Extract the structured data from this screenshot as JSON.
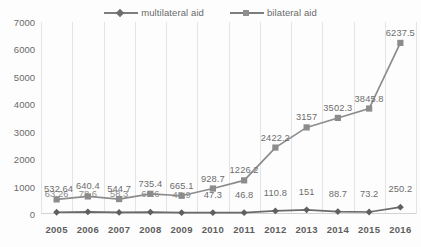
{
  "chart_data": {
    "type": "line",
    "title": "",
    "xlabel": "",
    "ylabel": "",
    "categories": [
      "2005",
      "2006",
      "2007",
      "2008",
      "2009",
      "2010",
      "2011",
      "2012",
      "2013",
      "2014",
      "2015",
      "2016"
    ],
    "ylim": [
      0,
      7000
    ],
    "y_ticks": [
      "0",
      "1000",
      "2000",
      "3000",
      "4000",
      "5000",
      "6000",
      "7000"
    ],
    "grid": "vertical",
    "legend_position": "top-center",
    "series": [
      {
        "name": "multilateral aid",
        "marker": "diamond",
        "color": "#5f5f5f",
        "values": [
          63.26,
          78.6,
          58.3,
          69.6,
          48.9,
          47.3,
          46.8,
          110.8,
          151,
          88.7,
          73.2,
          250.2
        ],
        "labels": [
          "63.26",
          "78.6",
          "58.3",
          "69.6",
          "48.9",
          "47.3",
          "46.8",
          "110.8",
          "151",
          "88.7",
          "73.2",
          "250.2"
        ]
      },
      {
        "name": "bilateral aid",
        "marker": "square",
        "color": "#8c8c8c",
        "values": [
          532.64,
          640.4,
          544.7,
          735.4,
          665.1,
          928.7,
          1226.2,
          2422.2,
          3157,
          3502.3,
          3845.8,
          6237.5
        ],
        "labels": [
          "532.64",
          "640.4",
          "544.7",
          "735.4",
          "665.1",
          "928.7",
          "1226.2",
          "2422.2",
          "3157",
          "3502.3",
          "3845.8",
          "6237.5"
        ]
      }
    ]
  },
  "legend": {
    "entries": [
      {
        "label": "multilateral aid",
        "marker": "diamond-marker-icon"
      },
      {
        "label": "bilateral aid",
        "marker": "square-marker-icon"
      }
    ]
  }
}
